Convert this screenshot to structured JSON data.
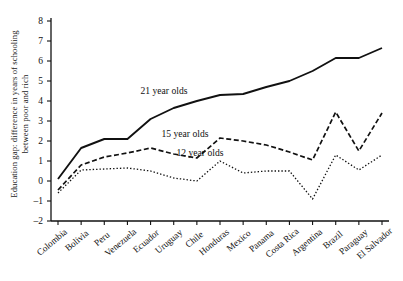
{
  "chart_data": {
    "type": "line",
    "title": "",
    "subtitle": "",
    "xlabel": "",
    "ylabel": "Education gap: difference in years of schooling between poor and rich",
    "ylabel_line1": "Education gap: difference in years of schooling",
    "ylabel_line2": "between poor and rich",
    "ylim": [
      -2,
      8
    ],
    "yticks": [
      -2,
      -1,
      0,
      1,
      2,
      3,
      4,
      5,
      6,
      7,
      8
    ],
    "ytick_labels": [
      "–2",
      "–1",
      "0",
      "1",
      "2",
      "3",
      "4",
      "5",
      "6",
      "7",
      "8"
    ],
    "grid": false,
    "legend_position": "inline-annotations",
    "categories": [
      "Colombia",
      "Bolivia",
      "Peru",
      "Venezuela",
      "Ecuador",
      "Uruguay",
      "Chile",
      "Honduras",
      "Mexico",
      "Panama",
      "Costa Rica",
      "Argentina",
      "Brazil",
      "Paraguay",
      "El Salvador"
    ],
    "series": [
      {
        "name": "21 year olds",
        "style": "solid",
        "color": "#111111",
        "values": [
          0.1,
          1.65,
          2.1,
          2.1,
          3.1,
          3.65,
          4.0,
          4.3,
          4.35,
          4.7,
          5.0,
          5.5,
          6.15,
          6.15,
          6.65
        ]
      },
      {
        "name": "15 year olds",
        "style": "dashed",
        "color": "#111111",
        "values": [
          -0.45,
          0.8,
          1.2,
          1.4,
          1.65,
          1.35,
          1.15,
          2.15,
          2.0,
          1.8,
          1.45,
          1.05,
          3.45,
          1.5,
          3.4
        ]
      },
      {
        "name": "12 year olds",
        "style": "dotted",
        "color": "#111111",
        "values": [
          -0.6,
          0.55,
          0.6,
          0.65,
          0.5,
          0.15,
          0.0,
          1.0,
          0.4,
          0.5,
          0.5,
          -0.9,
          1.3,
          0.55,
          1.3
        ]
      }
    ],
    "annotations": [
      {
        "text": "21 year olds",
        "x": 164,
        "y": 85
      },
      {
        "text": "15 year olds",
        "x": 185,
        "y": 128
      },
      {
        "text": "12 year olds",
        "x": 200,
        "y": 147
      }
    ]
  }
}
